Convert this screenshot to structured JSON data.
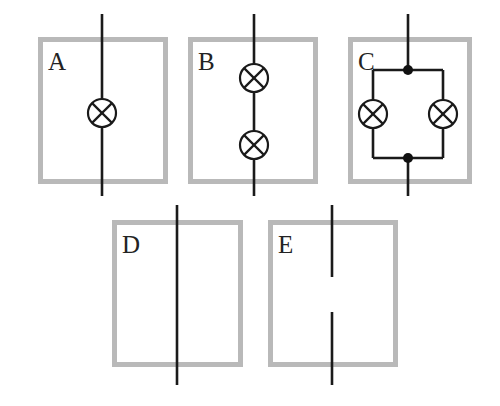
{
  "figure": {
    "background_color": "#ffffff",
    "box_border_color": "#b9b9b9",
    "box_border_width": 5,
    "wire_color": "#1a1a1a",
    "wire_width": 2.6,
    "lamp_stroke_color": "#1a1a1a",
    "lamp_stroke_width": 2.2,
    "lamp_radius": 14,
    "junction_dot_color": "#111111",
    "junction_dot_radius": 5,
    "label_color": "#232323",
    "label_font_size": 25,
    "width": 500,
    "height": 406
  },
  "panels": [
    {
      "id": "A",
      "label": "A",
      "label_x": 48,
      "label_y": 70,
      "box": {
        "x": 38,
        "y": 37,
        "width": 130,
        "height": 147
      },
      "description": "single lamp in series on a vertical wire",
      "wire": {
        "x": 102,
        "y_top": 14,
        "y_bottom": 196
      },
      "lamps": [
        {
          "cx": 102,
          "cy": 113
        }
      ],
      "junctions": [],
      "gap": null
    },
    {
      "id": "B",
      "label": "B",
      "label_x": 198,
      "label_y": 70,
      "box": {
        "x": 188,
        "y": 37,
        "width": 130,
        "height": 147
      },
      "description": "two lamps in series on a vertical wire",
      "wire": {
        "x": 254,
        "y_top": 14,
        "y_bottom": 196
      },
      "lamps": [
        {
          "cx": 254,
          "cy": 78
        },
        {
          "cx": 254,
          "cy": 145
        }
      ],
      "junctions": [],
      "gap": null
    },
    {
      "id": "C",
      "label": "C",
      "label_x": 358,
      "label_y": 70,
      "box": {
        "x": 348,
        "y": 37,
        "width": 124,
        "height": 147
      },
      "description": "two lamps in parallel between two junction dots",
      "wire": {
        "x": 408,
        "y_top": 14,
        "y_bottom": 196
      },
      "lamps": [
        {
          "cx": 373,
          "cy": 114
        },
        {
          "cx": 443,
          "cy": 114
        }
      ],
      "junctions": [
        {
          "cx": 408,
          "cy": 70
        },
        {
          "cx": 408,
          "cy": 158
        }
      ],
      "parallel_branch": {
        "left_x": 373,
        "right_x": 443,
        "top_y": 70,
        "bottom_y": 158
      },
      "gap": null
    },
    {
      "id": "D",
      "label": "D",
      "label_x": 122,
      "label_y": 253,
      "box": {
        "x": 112,
        "y": 220,
        "width": 131,
        "height": 147
      },
      "description": "plain continuous vertical wire, no component",
      "wire": {
        "x": 177,
        "y_top": 205,
        "y_bottom": 385
      },
      "lamps": [],
      "junctions": [],
      "gap": null
    },
    {
      "id": "E",
      "label": "E",
      "label_x": 278,
      "label_y": 253,
      "box": {
        "x": 268,
        "y": 220,
        "width": 130,
        "height": 147
      },
      "description": "vertical wire with a break (gap) in the middle",
      "wire": {
        "x": 332,
        "y_top": 205,
        "y_bottom": 385
      },
      "lamps": [],
      "junctions": [],
      "gap": {
        "y_start": 277,
        "y_end": 312
      }
    }
  ],
  "icons": {
    "lamp": "lamp-circle-cross-icon",
    "junction": "junction-dot-icon",
    "wire": "wire-segment-icon",
    "panel_box": "panel-box-icon"
  }
}
